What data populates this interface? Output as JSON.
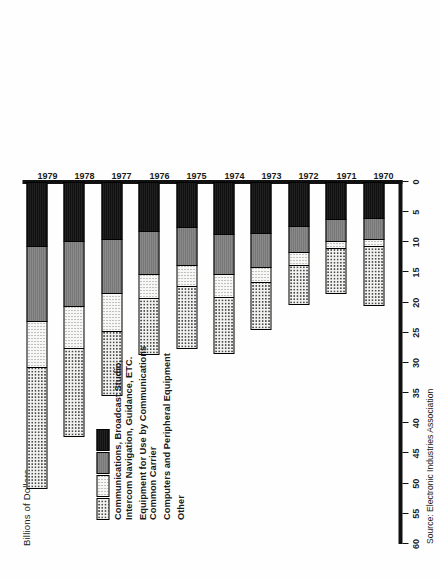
{
  "chart_data": {
    "type": "bar",
    "orientation": "horizontal-stacked",
    "title": "",
    "subtitle": "",
    "xlabel": "",
    "ylabel": "Billions of Dollars",
    "axis_title": "Billions of Dollars",
    "ylim": [
      0,
      60
    ],
    "grid": false,
    "legend_position": "inside-left",
    "tick_labels": [
      "60",
      "55",
      "50",
      "45",
      "40",
      "35",
      "30",
      "25",
      "20",
      "15",
      "10",
      "5",
      "0"
    ],
    "tick_values": [
      60,
      55,
      50,
      45,
      40,
      35,
      30,
      25,
      20,
      15,
      10,
      5,
      0
    ],
    "categories": [
      "1970",
      "1971",
      "1972",
      "1973",
      "1974",
      "1975",
      "1976",
      "1977",
      "1978",
      "1979"
    ],
    "series": [
      {
        "name": "Other",
        "pattern": "solid-black",
        "color": "#151515",
        "values": [
          6.0,
          6.2,
          7.3,
          8.5,
          8.7,
          7.4,
          8.1,
          9.4,
          9.8,
          10.6
        ]
      },
      {
        "name": "Computers and Peripheral Equipment",
        "pattern": "solid-grey",
        "color": "#7d7d7d",
        "values": [
          3.4,
          3.5,
          4.3,
          5.6,
          6.5,
          6.4,
          7.2,
          9.0,
          10.7,
          12.4
        ]
      },
      {
        "name": "Equipment for Use by Communications Common Carrier",
        "pattern": "fine-dots",
        "color": "#f7f7f5",
        "values": [
          1.2,
          1.3,
          2.2,
          2.4,
          3.9,
          3.4,
          3.9,
          6.3,
          7.0,
          7.7
        ]
      },
      {
        "name": "Communications, Broadcast Studio, Intercom Navigation, Guidance, ETC.",
        "pattern": "coarse-dots",
        "color": "#f2f2f0",
        "values": [
          10.0,
          7.5,
          6.6,
          8.0,
          9.4,
          10.5,
          9.5,
          10.8,
          14.7,
          20.2
        ]
      }
    ],
    "totals": [
      20.6,
      18.5,
      20.4,
      24.5,
      28.5,
      27.7,
      28.7,
      35.5,
      42.2,
      50.9
    ],
    "source_note": "Source: Electronic Industries Association"
  },
  "legend": {
    "items": [
      {
        "swatch": "coarse-dots",
        "line1": "Communications, Broadcast Studio,",
        "line2": "Intercom Navigation, Guidance, ETC."
      },
      {
        "swatch": "fine-dots",
        "line1": "Equipment for Use by Communications",
        "line2": "Common Carrier"
      },
      {
        "swatch": "solid-grey",
        "line1": "Computers and Peripheral Equipment",
        "line2": ""
      },
      {
        "swatch": "solid-black",
        "line1": "Other",
        "line2": ""
      }
    ]
  },
  "footer": {
    "source": "Source: Electronic Industries Association"
  },
  "colors": {
    "axis": "#111111",
    "coarse_dots_bg": "#f2f2f0",
    "fine_dots_bg": "#f7f7f5",
    "grey": "#7d7d7d",
    "black": "#151515"
  }
}
